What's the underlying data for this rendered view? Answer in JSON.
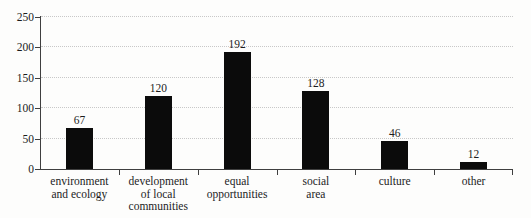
{
  "chart_data": {
    "type": "bar",
    "title": "",
    "xlabel": "",
    "ylabel": "",
    "categories": [
      "environment and ecology",
      "development of local communities",
      "equal opportunities",
      "social area",
      "culture",
      "other"
    ],
    "category_lines": [
      [
        "environment",
        "and ecology"
      ],
      [
        "development",
        "of local",
        "communities"
      ],
      [
        "equal",
        "opportunities"
      ],
      [
        "social",
        "area"
      ],
      [
        "culture"
      ],
      [
        "other"
      ]
    ],
    "values": [
      67,
      120,
      192,
      128,
      46,
      12
    ],
    "value_labels": [
      "67",
      "120",
      "192",
      "128",
      "46",
      "12"
    ],
    "ylim": [
      0,
      250
    ],
    "ytick_step": 50,
    "ytick_labels": [
      "0",
      "50",
      "100",
      "150",
      "200",
      "250"
    ],
    "grid": "horizontal-dotted",
    "legend": "none",
    "colors": {
      "bar": "#0b0b0b",
      "axis": "#3f3f3f",
      "gridline": "#c8c8c8",
      "text": "#1c1c1c",
      "background": "#fdfdfc"
    }
  }
}
